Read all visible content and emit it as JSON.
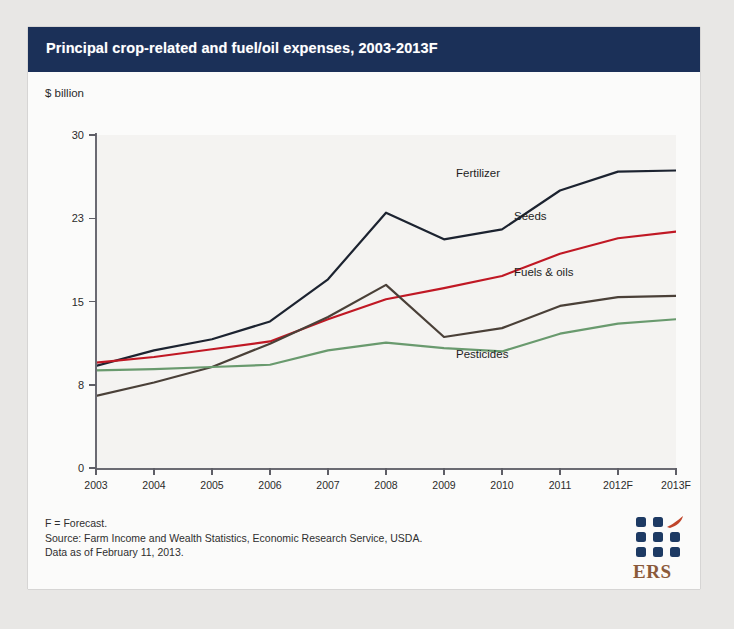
{
  "header": {
    "title": "Principal crop-related and fuel/oil expenses, 2003-2013F",
    "bar_color": "#1b3058"
  },
  "axes": {
    "y_unit_label": "$ billion"
  },
  "footer": {
    "line1": "F = Forecast.",
    "line2": "Source: Farm Income and Wealth Statistics, Economic Research Service, USDA.",
    "line3": "Data as of February 11, 2013."
  },
  "logo": {
    "wordmark": "ERS",
    "dot_color": "#1d3a63",
    "swoosh_color": "#c0452a",
    "wordmark_color": "#8a5a3a"
  },
  "chart_data": {
    "type": "line",
    "title": "Principal crop-related and fuel/oil expenses, 2003-2013F",
    "xlabel": "",
    "ylabel": "$ billion",
    "ylim": [
      0,
      30
    ],
    "yticks": [
      0,
      8,
      15,
      23,
      30
    ],
    "ytick_labels": [
      "0",
      "8",
      "15",
      "23",
      "30"
    ],
    "ytick_positions": [
      0,
      7.5,
      15,
      22.5,
      30
    ],
    "grid": false,
    "legend": "inline-labels",
    "categories": [
      "2003",
      "2004",
      "2005",
      "2006",
      "2007",
      "2008",
      "2009",
      "2010",
      "2011",
      "2012F",
      "2013F"
    ],
    "series": [
      {
        "name": "Fertilizer",
        "color": "#1c2330",
        "values": [
          9.2,
          10.6,
          11.6,
          13.2,
          17.0,
          23.0,
          20.6,
          21.5,
          25.0,
          26.7,
          26.8
        ],
        "label_x": "2010",
        "label_value": 26.5
      },
      {
        "name": "Seeds",
        "color": "#c01824",
        "values": [
          9.5,
          10.0,
          10.7,
          11.4,
          13.4,
          15.2,
          16.2,
          17.3,
          19.3,
          20.7,
          21.3
        ],
        "label_x": "2011",
        "label_value": 22.6
      },
      {
        "name": "Fuels & oils",
        "color": "#4a4038",
        "values": [
          6.5,
          7.7,
          9.1,
          11.2,
          13.6,
          16.5,
          11.8,
          12.6,
          14.6,
          15.4,
          15.5
        ],
        "label_x": "2011",
        "label_value": 17.6
      },
      {
        "name": "Pesticides",
        "color": "#699a6e",
        "values": [
          8.8,
          8.9,
          9.1,
          9.3,
          10.6,
          11.3,
          10.8,
          10.5,
          12.1,
          13.0,
          13.4
        ],
        "label_x": "2010",
        "label_value": 10.2
      }
    ]
  }
}
